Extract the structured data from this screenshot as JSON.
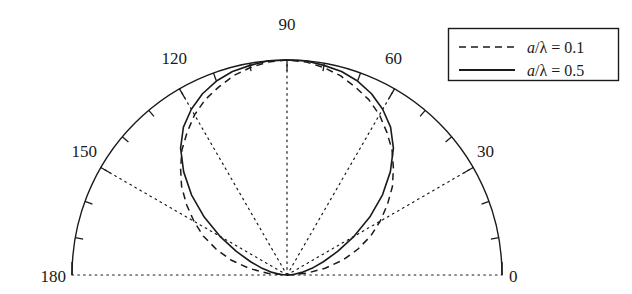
{
  "figure": {
    "type": "polar-half-plot",
    "background_color": "#ffffff",
    "line_color": "#1a1a1a"
  },
  "chart_data": {
    "type": "line",
    "title": "",
    "subtitle": "",
    "xlabel": "",
    "ylabel": "",
    "coordinate_system": "polar-half",
    "angle_unit": "degrees",
    "angle_range": [
      0,
      180
    ],
    "radial_range": [
      0,
      1
    ],
    "grid": true,
    "grid_style": "dotted",
    "grid_angles": [
      0,
      30,
      60,
      90,
      120,
      150,
      180
    ],
    "tick_angles": [
      0,
      10,
      20,
      30,
      40,
      50,
      60,
      70,
      80,
      90,
      100,
      110,
      120,
      130,
      140,
      150,
      160,
      170,
      180
    ],
    "tick_labels": [
      "0",
      "30",
      "60",
      "90",
      "120",
      "150",
      "180"
    ],
    "tick_label_angles": [
      0,
      30,
      60,
      90,
      120,
      150,
      180
    ],
    "legend_position": "top-right",
    "series": [
      {
        "name": "a/λ = 0.1",
        "label_numerator": "a",
        "label_denominator": "λ",
        "label_value": "0.1",
        "style": "dashed",
        "aperture_ratio": 0.1,
        "angles": [
          0,
          5,
          10,
          15,
          20,
          25,
          30,
          35,
          40,
          45,
          50,
          55,
          60,
          65,
          70,
          75,
          80,
          85,
          90,
          95,
          100,
          105,
          110,
          115,
          120,
          125,
          130,
          135,
          140,
          145,
          150,
          155,
          160,
          165,
          170,
          175,
          180
        ],
        "values": [
          0.0,
          0.09,
          0.18,
          0.27,
          0.35,
          0.43,
          0.5,
          0.57,
          0.64,
          0.7,
          0.76,
          0.81,
          0.86,
          0.9,
          0.93,
          0.96,
          0.98,
          0.995,
          1.0,
          0.995,
          0.98,
          0.96,
          0.93,
          0.9,
          0.86,
          0.81,
          0.76,
          0.7,
          0.64,
          0.57,
          0.5,
          0.43,
          0.35,
          0.27,
          0.18,
          0.09,
          0.0
        ]
      },
      {
        "name": "a/λ = 0.5",
        "label_numerator": "a",
        "label_denominator": "λ",
        "label_value": "0.5",
        "style": "solid",
        "aperture_ratio": 0.5,
        "angles": [
          0,
          5,
          10,
          15,
          20,
          25,
          30,
          35,
          40,
          45,
          50,
          55,
          60,
          65,
          70,
          75,
          80,
          85,
          90,
          95,
          100,
          105,
          110,
          115,
          120,
          125,
          130,
          135,
          140,
          145,
          150,
          155,
          160,
          165,
          170,
          175,
          180
        ],
        "values": [
          0.0,
          0.03,
          0.07,
          0.12,
          0.18,
          0.26,
          0.36,
          0.47,
          0.58,
          0.68,
          0.77,
          0.84,
          0.89,
          0.93,
          0.96,
          0.98,
          0.99,
          1.0,
          1.0,
          1.0,
          0.99,
          0.98,
          0.96,
          0.93,
          0.89,
          0.84,
          0.77,
          0.68,
          0.58,
          0.47,
          0.36,
          0.26,
          0.18,
          0.12,
          0.07,
          0.03,
          0.0
        ]
      }
    ]
  },
  "axis_labels": {
    "a0": "0",
    "a30": "30",
    "a60": "60",
    "a90": "90",
    "a120": "120",
    "a150": "150",
    "a180": "180"
  },
  "legend": {
    "entries": [
      {
        "sample_style": "dashed",
        "var": "a",
        "slash": "/",
        "lambda": "λ",
        "equals": "=",
        "value": "0.1"
      },
      {
        "sample_style": "solid",
        "var": "a",
        "slash": "/",
        "lambda": "λ",
        "equals": "=",
        "value": "0.5"
      }
    ]
  }
}
